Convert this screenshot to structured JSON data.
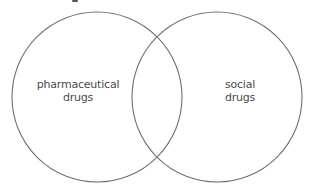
{
  "diagram": {
    "type": "venn",
    "sets": [
      {
        "id": "left",
        "label_lines": [
          "pharmaceutical",
          "drugs"
        ]
      },
      {
        "id": "right",
        "label_lines": [
          "social",
          "drugs"
        ]
      }
    ],
    "colors": {
      "stroke": "#6f6f6f",
      "text": "#4a4a4a",
      "background": "#ffffff"
    }
  }
}
